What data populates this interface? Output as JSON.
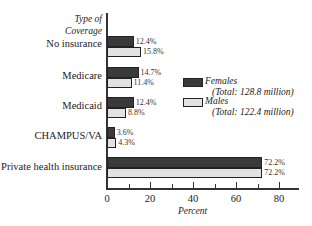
{
  "chart_data": {
    "type": "bar",
    "orientation": "horizontal",
    "title": "",
    "ylabel": "Type of Coverage",
    "xlabel": "Percent",
    "xlim": [
      0,
      85
    ],
    "xticks": [
      0,
      20,
      40,
      60,
      80
    ],
    "grid": false,
    "legend_position": "right",
    "categories": [
      "No insurance",
      "Medicare",
      "Medicaid",
      "CHAMPUS/VA",
      "Private health insurance"
    ],
    "series": [
      {
        "name": "Females",
        "note": "(Total: 128.8 million)",
        "color": "#3a3a3a",
        "values": [
          12.4,
          14.7,
          12.4,
          3.6,
          72.2
        ],
        "labels": [
          "12.4%",
          "14.7%",
          "12.4%",
          "3.6%",
          "72.2%"
        ]
      },
      {
        "name": "Males",
        "note": "(Total: 122.4 million)",
        "color": "#e2e2e2",
        "values": [
          15.8,
          11.4,
          8.8,
          4.3,
          72.2
        ],
        "labels": [
          "15.8%",
          "11.4%",
          "8.8%",
          "4.3%",
          "72.2%"
        ]
      }
    ]
  },
  "axis": {
    "ytitle_line1": "Type of",
    "ytitle_line2": "Coverage",
    "xtitle": "Percent",
    "ticks": [
      "0",
      "20",
      "40",
      "60",
      "80"
    ]
  },
  "legend": {
    "female_label": "Females",
    "female_total": "(Total: 128.8 million)",
    "male_label": "Males",
    "male_total": "(Total: 122.4 million)"
  }
}
